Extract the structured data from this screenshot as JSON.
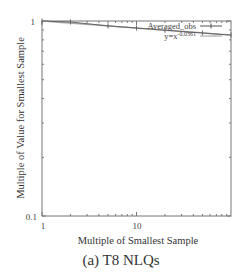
{
  "chart_data": {
    "type": "line",
    "title": "",
    "caption": "(a) T8 NLQs",
    "xlabel": "Multiple of Smallest Sample",
    "ylabel": "Multiple of Value for Smallest Sample",
    "xscale": "log",
    "yscale": "log",
    "xlim": [
      1,
      100
    ],
    "ylim": [
      0.1,
      1
    ],
    "x_ticks": [
      {
        "value": 1,
        "label": "1"
      },
      {
        "value": 10,
        "label": "10"
      }
    ],
    "y_ticks": [
      {
        "value": 0.1,
        "label": "0.1"
      },
      {
        "value": 1,
        "label": "1"
      }
    ],
    "grid": false,
    "legend_position": "top-right",
    "series": [
      {
        "name": "Averaged_obs",
        "style": "line-points",
        "color": "#666666",
        "x": [
          1,
          2,
          5,
          10,
          20,
          50,
          100
        ],
        "y": [
          1.0,
          0.988,
          0.944,
          0.92,
          0.897,
          0.868,
          0.847
        ]
      },
      {
        "name": "y=x^-0.0361",
        "style": "line",
        "color": "#aaaaaa",
        "exponent": -0.0361,
        "x": [
          1,
          100
        ],
        "y": [
          1.0,
          0.847
        ]
      }
    ]
  },
  "labels": {
    "y_tick_top": "1",
    "y_tick_bottom": "0.1",
    "x_tick_1": "1",
    "x_tick_10": "10",
    "legend_1": "Averaged_obs",
    "legend_2_prefix": "y=x",
    "legend_2_exp": "-0.0361",
    "legend_2_full": "y=x^-0.0361"
  }
}
